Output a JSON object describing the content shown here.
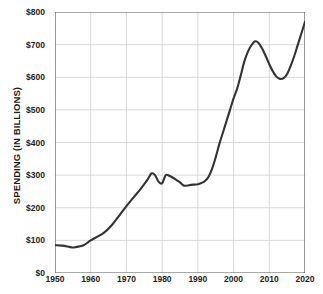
{
  "chart_data": {
    "type": "line",
    "title": "",
    "subtitle": "",
    "xlabel": "",
    "ylabel": "SPENDING (IN BILLIONS)",
    "xlim": [
      1950,
      2020
    ],
    "ylim": [
      0,
      800
    ],
    "grid": true,
    "legend": false,
    "legend_position": "none",
    "line_color": "#333333",
    "grid_color": "#d9d9d9",
    "axis_color": "#555555",
    "background_color": "#ffffff",
    "x_tick_labels": [
      "1950",
      "1960",
      "1970",
      "1980",
      "1990",
      "2000",
      "2010",
      "2020"
    ],
    "x_ticks": [
      1950,
      1960,
      1970,
      1980,
      1990,
      2000,
      2010,
      2020
    ],
    "y_tick_labels": [
      "$0",
      "$100",
      "$200",
      "$300",
      "$400",
      "$500",
      "$600",
      "$700",
      "$800"
    ],
    "y_ticks": [
      0,
      100,
      200,
      300,
      400,
      500,
      600,
      700,
      800
    ],
    "series": [
      {
        "name": "Spending",
        "x": [
          1950,
          1952,
          1954,
          1955,
          1956,
          1958,
          1960,
          1962,
          1964,
          1966,
          1968,
          1970,
          1972,
          1974,
          1976,
          1977,
          1978,
          1979,
          1980,
          1981,
          1982,
          1983,
          1984,
          1985,
          1986,
          1987,
          1988,
          1989,
          1990,
          1991,
          1992,
          1993,
          1994,
          1995,
          1996,
          1997,
          1998,
          1999,
          2000,
          2001,
          2002,
          2003,
          2004,
          2005,
          2006,
          2007,
          2008,
          2009,
          2010,
          2011,
          2012,
          2013,
          2014,
          2015,
          2016,
          2017,
          2018,
          2019,
          2020
        ],
        "values": [
          85,
          84,
          80,
          78,
          80,
          85,
          100,
          112,
          126,
          148,
          176,
          205,
          232,
          258,
          288,
          305,
          300,
          280,
          275,
          300,
          298,
          292,
          285,
          278,
          268,
          268,
          270,
          271,
          272,
          276,
          282,
          295,
          320,
          355,
          395,
          430,
          465,
          500,
          535,
          565,
          605,
          648,
          678,
          698,
          710,
          705,
          688,
          665,
          640,
          618,
          602,
          595,
          597,
          610,
          635,
          665,
          700,
          735,
          770
        ]
      }
    ],
    "annotations": []
  }
}
